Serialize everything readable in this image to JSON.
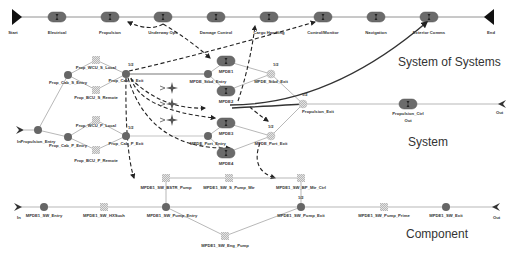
{
  "layers": {
    "sos": "System of Systems",
    "system": "System",
    "component": "Component"
  },
  "colors": {
    "line": "#888888",
    "node_dark": "#666666",
    "pill": "#6b6b6b",
    "hatch": "#bbbbbb",
    "dashed": "#222222",
    "curve": "#333333"
  },
  "sos": {
    "start": "Start",
    "end": "End",
    "stages": [
      "Electrical",
      "Propulsion",
      "Underway Ops",
      "Damage Control",
      "Cargo Handling",
      "Control/Monitor",
      "Navigation",
      "Exterior Comms"
    ]
  },
  "system": {
    "in": "In",
    "out": "Out",
    "nodes": {
      "propulsion_entry": "Propulsion_Entry",
      "prop_cab_s_entry": "Prop_Cab_S_Entry",
      "prop_wcu_s_local": "Prop_WCU_S_Local",
      "prop_bcu_s_remote": "Prop_BCU_S_Remote",
      "prop_cab_s_exit": "Prop_Cab_S_Exit",
      "prop_cab_p_entry": "Prop_Cab_P_Entry",
      "prop_wcu_p_local": "Prop_WCU_P_Local",
      "prop_bcu_p_remote": "Prop_BCU_P_Remote",
      "prop_cab_p_exit": "Prop_Cab_P_Exit",
      "mpde_stbd_entry": "MPDE_Stbd_Entry",
      "mpde1": "MPDE1",
      "mpde2": "MPDE2",
      "mpde_stbd_exit": "MPDE_Stbd_Exit",
      "mpde3": "MPDE3",
      "mpde4": "MPDE4",
      "mpde_port_entry": "MPDE_Port_Entry",
      "mpde_port_exit": "MPDE_Port_Exit",
      "propulsion_exit": "Propulsion_Exit",
      "propulsion_ctrl": "Propulsion_Ctrl",
      "ctrl_sub": "Out"
    },
    "fractions": {
      "s_exit": "1/2",
      "p_exit": "1/2",
      "stbd_exit": "1/2",
      "port_exit": "1/2",
      "prop_exit": "1/2"
    }
  },
  "component": {
    "in": "In",
    "out": "Out",
    "nodes": {
      "sw_entry": "MPDE1_SW_Entry",
      "sw_hxsuch": "MPDE1_SW_HXSuch",
      "sw_pump_entry": "MPDE1_SW_Pump_Entry",
      "sw_bstr_pump": "MPDE1_SW_BSTR_Pump",
      "sw_s_pump_mtr": "MPDE1_SW_S_Pump_Mtr",
      "sw_bp_mtr_ctrl": "MPDE1_SW_BP_Mtr_Ctrl",
      "sw_eng_pump": "MPDE1_SW_Eng_Pump",
      "sw_pump_exit": "MPDE1_SW_Pump_Exit",
      "sw_pump_prime": "MPDE1_SW_Pump_Prime",
      "sw_exit": "MPDE1_SW_Exit"
    },
    "fractions": {
      "pump_exit": "1/2"
    }
  }
}
